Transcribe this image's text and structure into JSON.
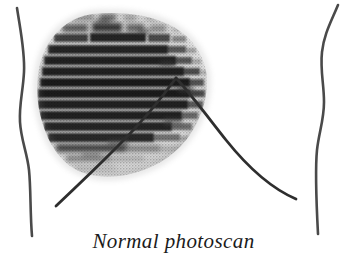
{
  "figure": {
    "title": "Normal photoscan",
    "caption": "Normal photoscan",
    "background_color": "#ffffff",
    "ink_color": "#3a3a3a",
    "scan_dark_color": "#2b2b2b",
    "scan_mid_color": "#7d7d7d",
    "scan_faint_color": "#c9c9c9",
    "outline_color": "#4a4a4a",
    "costal_margin_color": "#2e2e2e",
    "labels": {
      "left_body_outline": "left body outline",
      "right_body_outline": "right body outline",
      "scan_region": "liver photoscan region",
      "costal_margin_left": "left costal margin",
      "costal_margin_right": "right costal margin"
    },
    "scan": {
      "band_count": 14,
      "band_spacing_px": 11.5,
      "top_px": 14,
      "bottom_px": 176,
      "left_px": 38,
      "right_px": 207,
      "apex_x_px": 176,
      "apex_y_px": 78
    }
  }
}
